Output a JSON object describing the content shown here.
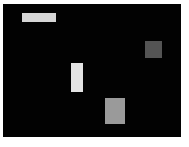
{
  "canvas": {
    "background": "#020202",
    "border_color": "#ffffff"
  },
  "shapes": [
    {
      "name": "top-bar",
      "x": 22,
      "y": 13,
      "w": 34,
      "h": 9,
      "color": "#d6d6d6"
    },
    {
      "name": "dark-square",
      "x": 145,
      "y": 41,
      "w": 17,
      "h": 17,
      "color": "#545454"
    },
    {
      "name": "tall-rect",
      "x": 71,
      "y": 63,
      "w": 12,
      "h": 29,
      "color": "#e4e4e4"
    },
    {
      "name": "gray-square",
      "x": 105,
      "y": 98,
      "w": 20,
      "h": 26,
      "color": "#9a9a9a"
    }
  ]
}
